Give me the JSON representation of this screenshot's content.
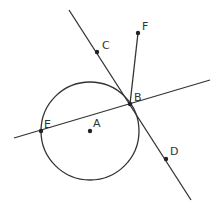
{
  "diagram": {
    "type": "geometry",
    "colors": {
      "stroke": "#333333",
      "point": "#222222",
      "label": "#333333",
      "background": "#ffffff"
    },
    "circle": {
      "center_label": "A",
      "cx": 90,
      "cy": 131,
      "r": 49
    },
    "points": [
      {
        "label": "A",
        "x": 90,
        "y": 131,
        "lx": 93,
        "ly": 127
      },
      {
        "label": "B",
        "x": 130,
        "y": 104,
        "lx": 134,
        "ly": 101
      },
      {
        "label": "C",
        "x": 97,
        "y": 52,
        "lx": 102,
        "ly": 49
      },
      {
        "label": "D",
        "x": 166,
        "y": 159,
        "lx": 170,
        "ly": 155
      },
      {
        "label": "E",
        "x": 41,
        "y": 131,
        "lx": 44,
        "ly": 128
      },
      {
        "label": "F",
        "x": 138,
        "y": 33,
        "lx": 142,
        "ly": 30
      }
    ],
    "lines": [
      {
        "name": "tangent-line-cd",
        "x1": 69,
        "y1": 10,
        "x2": 191,
        "y2": 200
      },
      {
        "name": "secant-line-eb",
        "x1": 14,
        "y1": 138,
        "x2": 210,
        "y2": 80
      }
    ],
    "segments": [
      {
        "name": "segment-bf",
        "x1": 130,
        "y1": 104,
        "x2": 138,
        "y2": 33
      }
    ]
  }
}
